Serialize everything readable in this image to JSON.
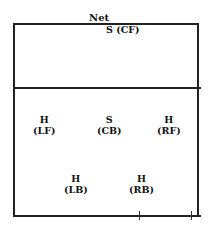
{
  "diagram": {
    "net_label": "Net",
    "players": [
      {
        "role": "S",
        "position": "(CF)",
        "text": "S (CF)"
      },
      {
        "role": "H",
        "position": "(LF)"
      },
      {
        "role": "S",
        "position": "(CB)"
      },
      {
        "role": "H",
        "position": "(RF)"
      },
      {
        "role": "H",
        "position": "(LB)"
      },
      {
        "role": "H",
        "position": "(RB)"
      }
    ]
  }
}
